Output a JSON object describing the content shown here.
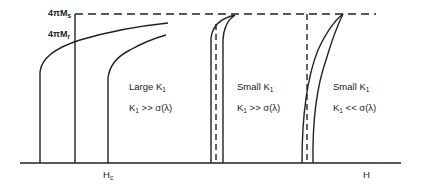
{
  "diagram": {
    "type": "magnetization-vs-field schematic",
    "y_axis_labels": {
      "saturation": {
        "prefix": "4πM",
        "sub": "s"
      },
      "remanence": {
        "prefix": "4πM",
        "sub": "r"
      }
    },
    "x_axis_labels": {
      "coercive_field": {
        "prefix": "H",
        "sub": "c"
      },
      "field": "H"
    },
    "regions": [
      {
        "title_prefix": "Large K",
        "title_sub": "1",
        "cond_prefix": "K",
        "cond_sub": "1",
        "cond_rest": " >> σ(λ)"
      },
      {
        "title_prefix": "Small K",
        "title_sub": "1",
        "cond_prefix": "K",
        "cond_sub": "1",
        "cond_rest": " >> σ(λ)"
      },
      {
        "title_prefix": "Small K",
        "title_sub": "1",
        "cond_prefix": "K",
        "cond_sub": "1",
        "cond_rest": " << σ(λ)"
      }
    ],
    "colors": {
      "line": "#222222",
      "background": "#ffffff"
    }
  }
}
